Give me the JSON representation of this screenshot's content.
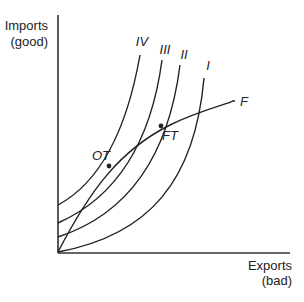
{
  "axes": {
    "y_label_line1": "Imports",
    "y_label_line2": "(good)",
    "x_label_line1": "Exports",
    "x_label_line2": "(bad)"
  },
  "curves": [
    {
      "id": "IV",
      "label": "IV",
      "type": "indifference"
    },
    {
      "id": "III",
      "label": "III",
      "type": "indifference"
    },
    {
      "id": "II",
      "label": "II",
      "type": "indifference"
    },
    {
      "id": "I",
      "label": "I",
      "type": "indifference"
    },
    {
      "id": "F",
      "label": "F",
      "type": "offer-curve"
    }
  ],
  "points": [
    {
      "id": "OT",
      "label": "OT",
      "on": [
        "F",
        "III"
      ]
    },
    {
      "id": "FT",
      "label": "FT",
      "on": [
        "F",
        "II"
      ]
    }
  ]
}
